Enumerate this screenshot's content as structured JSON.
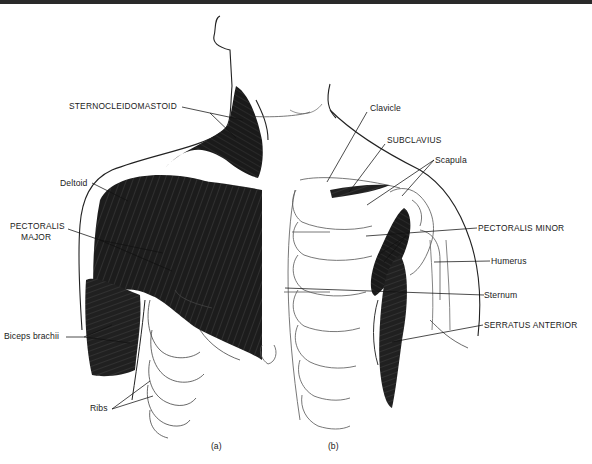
{
  "figure": {
    "panels": [
      {
        "id": "a",
        "label": "(a)"
      },
      {
        "id": "b",
        "label": "(b)"
      }
    ],
    "labels": {
      "sternocleidomastoid": "STERNOCLEIDOMASTOID",
      "deltoid": "Deltoid",
      "pectoralis_major_line1": "PECTORALIS",
      "pectoralis_major_line2": "MAJOR",
      "biceps_brachii": "Biceps brachii",
      "ribs": "Ribs",
      "clavicle": "Clavicle",
      "subclavius": "SUBCLAVIUS",
      "scapula": "Scapula",
      "pectoralis_minor": "PECTORALIS MINOR",
      "humerus": "Humerus",
      "sternum": "Sternum",
      "serratus_anterior": "SERRATUS ANTERIOR"
    },
    "colors": {
      "muscle": "#1e1e1e",
      "outline": "#222222",
      "bone_outline": "#555555",
      "background": "#ffffff"
    }
  }
}
